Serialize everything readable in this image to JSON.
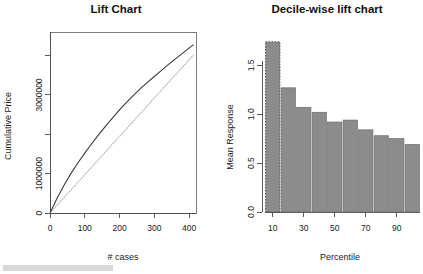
{
  "figure": {
    "width": 423,
    "height": 274,
    "background": "#ffffff",
    "watermark_color": "#d8d8d8"
  },
  "panels": {
    "left": {
      "title": "Lift Chart",
      "xlabel": "# cases",
      "ylabel": "Cumulative Price"
    },
    "right": {
      "title": "Decile-wise lift chart",
      "xlabel": "Percentile",
      "ylabel": "Mean Response"
    }
  },
  "chart_data": [
    {
      "type": "line",
      "title": "Lift Chart",
      "xlabel": "# cases",
      "ylabel": "Cumulative Price",
      "xlim": [
        0,
        420
      ],
      "ylim": [
        0,
        4600000
      ],
      "xticks": [
        0,
        100,
        200,
        300,
        400
      ],
      "xtick_labels": [
        "0",
        "100",
        "200",
        "300",
        "400"
      ],
      "yticks": [
        0,
        1000000,
        2000000,
        3000000,
        4000000
      ],
      "ytick_labels": [
        "0",
        "1000000",
        "",
        "3000000",
        ""
      ],
      "grid": false,
      "legend": "none",
      "series": [
        {
          "name": "Cumulative lift",
          "style": "solid",
          "color": "#3a3a3a",
          "x": [
            0,
            20,
            40,
            60,
            80,
            100,
            120,
            140,
            160,
            180,
            200,
            220,
            240,
            260,
            280,
            300,
            320,
            340,
            360,
            380,
            400,
            413
          ],
          "y": [
            0,
            370000,
            700000,
            1000000,
            1270000,
            1520000,
            1760000,
            1990000,
            2210000,
            2420000,
            2620000,
            2810000,
            2990000,
            3160000,
            3320000,
            3470000,
            3620000,
            3770000,
            3910000,
            4050000,
            4190000,
            4280000
          ]
        },
        {
          "name": "Baseline (random)",
          "style": "dotted",
          "color": "#b4b4b4",
          "x": [
            0,
            413
          ],
          "y": [
            0,
            4020000
          ]
        }
      ]
    },
    {
      "type": "bar",
      "title": "Decile-wise lift chart",
      "xlabel": "Percentile",
      "ylabel": "Mean Response",
      "categories": [
        10,
        20,
        30,
        40,
        50,
        60,
        70,
        80,
        90,
        100
      ],
      "values": [
        1.74,
        1.27,
        1.07,
        1.02,
        0.92,
        0.94,
        0.84,
        0.78,
        0.75,
        0.69
      ],
      "xticks": [
        10,
        30,
        50,
        70,
        90
      ],
      "xtick_labels": [
        "10",
        "30",
        "50",
        "70",
        "90"
      ],
      "yticks": [
        0.0,
        0.5,
        1.0,
        1.5
      ],
      "ytick_labels": [
        "0.0",
        "0.5",
        "1.0",
        "1.5"
      ],
      "ylim": [
        0,
        1.8
      ],
      "grid": false,
      "legend": "none",
      "bar_color": "#8c8c8c",
      "bar_edge_color": "#6a6a6a",
      "highlight_index": 0,
      "highlight_edge_color": "#4d4d4d"
    }
  ]
}
